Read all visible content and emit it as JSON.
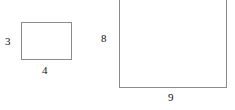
{
  "diagram": {
    "type": "geometry-figure",
    "canvas": {
      "width": 235,
      "height": 110,
      "background_color": "#ffffff"
    },
    "stroke_color": "#8c8c8c",
    "label_color": "#111111",
    "shapes": [
      {
        "id": "small-rectangle",
        "name": "small rectangle",
        "height_label": "3",
        "width_label": "4",
        "height_label_position": "left",
        "width_label_position": "bottom",
        "top_edge_visible": true
      },
      {
        "id": "large-rectangle",
        "name": "large rectangle",
        "height_label": "8",
        "width_label": "9",
        "height_label_position": "left",
        "width_label_position": "bottom",
        "top_edge_visible": false
      }
    ]
  }
}
